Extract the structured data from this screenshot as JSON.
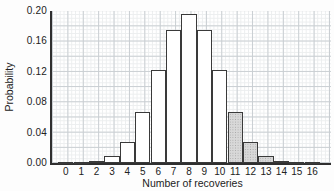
{
  "chart_data": {
    "type": "bar",
    "title": "",
    "xlabel": "Number of recoveries",
    "ylabel": "Probability",
    "categories": [
      "0",
      "1",
      "2",
      "3",
      "4",
      "5",
      "6",
      "7",
      "8",
      "9",
      "10",
      "11",
      "12",
      "13",
      "14",
      "15",
      "16"
    ],
    "values": [
      0.0,
      0.0,
      0.002,
      0.009,
      0.028,
      0.067,
      0.122,
      0.175,
      0.196,
      0.175,
      0.122,
      0.067,
      0.028,
      0.009,
      0.002,
      0.0,
      0.0
    ],
    "shaded_categories": [
      "11",
      "12",
      "13",
      "14",
      "15",
      "16"
    ],
    "ytick_labels": [
      "0.00",
      "0.04",
      "0.08",
      "0.12",
      "0.16",
      "0.20"
    ],
    "ytick_values": [
      0.0,
      0.04,
      0.08,
      0.12,
      0.16,
      0.2
    ],
    "ylim": [
      0,
      0.2
    ],
    "grid": "on",
    "legend": "none",
    "colors": {
      "background": "#ffffff",
      "text": "#222222",
      "axis": "#2f2f2f",
      "grid_major": "#c9ced2",
      "grid_minor": "#eceeef",
      "bar_fill": "#ffffff",
      "bar_fill_shaded": "#d8d8d8",
      "bar_border": "#3a3a3a",
      "stipple_dot": "#a6a6a6"
    }
  }
}
